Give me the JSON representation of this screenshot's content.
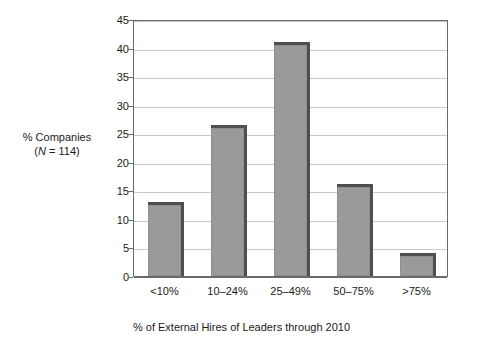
{
  "chart_data": {
    "type": "bar",
    "title": "",
    "categories": [
      "<10%",
      "10–24%",
      "25–49%",
      "50–75%",
      ">75%"
    ],
    "values": [
      12.5,
      26.0,
      40.5,
      15.5,
      3.5
    ],
    "xlabel": "% of External Hires of Leaders through 2010",
    "ylabel": "% Companies",
    "ylabel_line2_prefix": "(",
    "ylabel_line2_symbol": "N",
    "ylabel_line2_suffix": " = 114)",
    "ylim": [
      0,
      45
    ],
    "ytick_values": [
      0,
      5,
      10,
      15,
      20,
      25,
      30,
      35,
      40,
      45
    ],
    "ytick_labels": [
      "0",
      "5",
      "10",
      "15",
      "20",
      "25",
      "30",
      "35",
      "40",
      "45"
    ],
    "grid": true,
    "grid_axis": "y",
    "legend": false,
    "bar_color": "#9a9a9a",
    "bar_edge_color": "#4f4f4f",
    "gridline_color": "#c9c9c9",
    "frame_color": "#6a6a6a",
    "background_color": "#ffffff"
  }
}
